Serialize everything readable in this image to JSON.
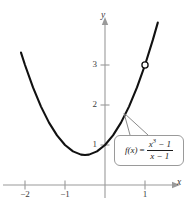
{
  "figure": {
    "background_color": "#ffffff",
    "curve_color": "#111111",
    "axis_color": "#9a9a9a",
    "text_color": "#3a3a3a"
  },
  "axes": {
    "x_name": "x",
    "y_name": "y",
    "x_ticks": [
      {
        "value": -2,
        "label": "−2"
      },
      {
        "value": -1,
        "label": "−1"
      },
      {
        "value": 1,
        "label": "1"
      }
    ],
    "y_ticks": [
      {
        "value": 1,
        "label": "1"
      },
      {
        "value": 2,
        "label": "2"
      },
      {
        "value": 3,
        "label": "3"
      }
    ]
  },
  "callout": {
    "function_name": "f(x)",
    "equals": "=",
    "numerator": "x",
    "numerator_exponent": "3",
    "numerator_rest": " − 1",
    "denominator": "x − 1",
    "full_text": "f(x) = (x³ − 1)/(x − 1)"
  },
  "chart_data": {
    "type": "line",
    "xlabel": "x",
    "ylabel": "y",
    "xlim": [
      -2.6,
      1.45
    ],
    "ylim": [
      -0.45,
      3.9
    ],
    "grid": false,
    "legend": null,
    "equation": "y = x^2 + x + 1",
    "series": [
      {
        "name": "f(x) = (x^3 - 1)/(x - 1)",
        "color": "#111111",
        "x": [
          -2.1,
          -2.0,
          -1.8,
          -1.6,
          -1.4,
          -1.2,
          -1.0,
          -0.8,
          -0.6,
          -0.5,
          -0.4,
          -0.2,
          0.0,
          0.2,
          0.4,
          0.6,
          0.8,
          1.0,
          1.2,
          1.32
        ],
        "values": [
          3.31,
          3.0,
          2.44,
          1.96,
          1.56,
          1.24,
          1.0,
          0.84,
          0.76,
          0.75,
          0.76,
          0.84,
          1.0,
          1.24,
          1.56,
          1.96,
          2.44,
          3.0,
          3.64,
          4.06
        ]
      }
    ],
    "vertex": {
      "x": -0.5,
      "y": 0.75
    },
    "annotations": [
      {
        "type": "open-circle",
        "x": 1,
        "y": 3,
        "meaning": "removable discontinuity (hole) at x = 1",
        "fill": "#ffffff",
        "stroke": "#111111"
      }
    ]
  }
}
